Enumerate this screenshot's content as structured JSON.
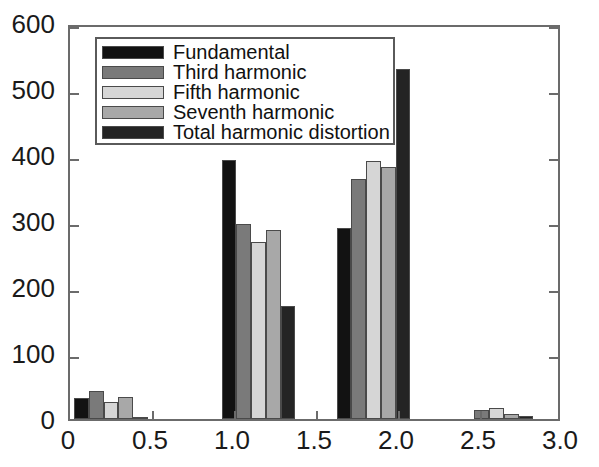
{
  "chart_data": {
    "type": "bar",
    "title": "",
    "xlabel": "",
    "ylabel": "",
    "xlim": [
      0,
      3.0
    ],
    "ylim": [
      0,
      600
    ],
    "grid": false,
    "legend_position": "top-left",
    "x_ticks": [
      "0",
      "0.5",
      "1.0",
      "1.5",
      "2.0",
      "2.5",
      "3.0"
    ],
    "x_tick_values": [
      0,
      0.5,
      1.0,
      1.5,
      2.0,
      2.5,
      3.0
    ],
    "y_ticks": [
      "0",
      "100",
      "200",
      "300",
      "400",
      "500",
      "600"
    ],
    "y_tick_values": [
      0,
      100,
      200,
      300,
      400,
      500,
      600
    ],
    "group_centers": [
      0.25,
      1.15,
      1.85,
      2.6
    ],
    "categories": [
      "Group 1",
      "Group 2",
      "Group 3",
      "Group 4"
    ],
    "series": [
      {
        "name": "Fundamental",
        "color": "#121212",
        "values": [
          32,
          393,
          290,
          0
        ]
      },
      {
        "name": "Third harmonic",
        "color": "#7a7a7a",
        "values": [
          42,
          295,
          363,
          14
        ]
      },
      {
        "name": "Fifth harmonic",
        "color": "#d6d6d6",
        "values": [
          26,
          268,
          391,
          16
        ]
      },
      {
        "name": "Seventh harmonic",
        "color": "#a8a8a8",
        "values": [
          33,
          287,
          382,
          8
        ]
      },
      {
        "name": "Total harmonic distortion",
        "color": "#242424",
        "values": [
          2,
          171,
          530,
          4
        ]
      }
    ]
  },
  "legend": {
    "items": [
      {
        "label": "Fundamental"
      },
      {
        "label": "Third harmonic"
      },
      {
        "label": "Fifth harmonic"
      },
      {
        "label": "Seventh harmonic"
      },
      {
        "label": "Total harmonic distortion"
      }
    ]
  },
  "axis_colors": {
    "frame": "#6b6b6b",
    "text": "#1a1a1a"
  }
}
